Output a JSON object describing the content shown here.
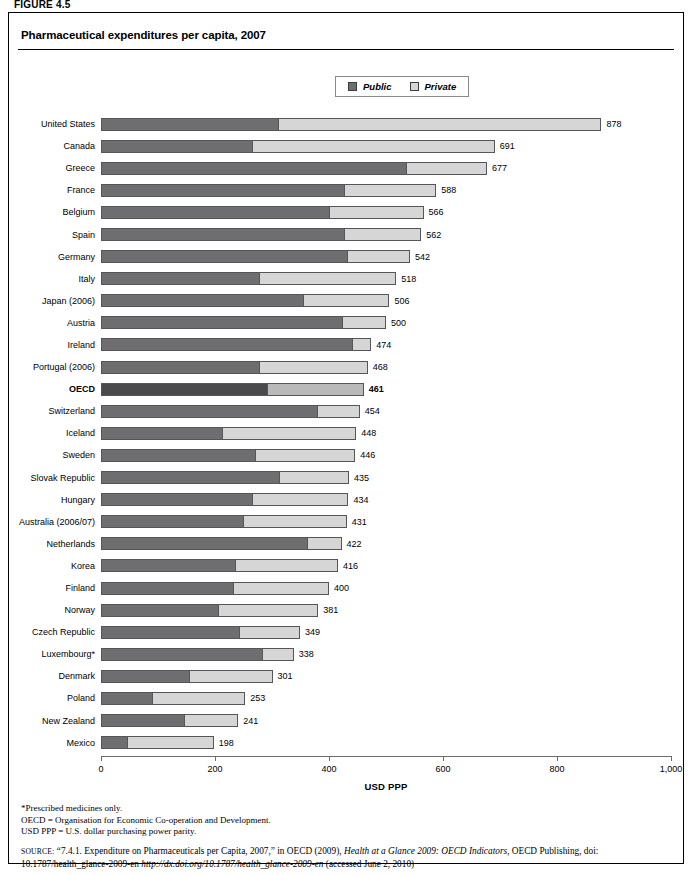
{
  "figure_label": "FIGURE 4.5",
  "chart_title": "Pharmaceutical expenditures per capita, 2007",
  "legend": {
    "public_label": "Public",
    "private_label": "Private",
    "public_color": "#6e6e70",
    "private_color": "#d6d6d6",
    "highlight_color": "#4a4a4c"
  },
  "axis": {
    "title": "USD PPP",
    "ticks": [
      "0",
      "200",
      "400",
      "600",
      "800",
      "1,000"
    ],
    "min": 0,
    "max": 1000
  },
  "notes": [
    "*Prescribed medicines only.",
    "OECD = Organisation for Economic Co-operation and Development.",
    "USD PPP = U.S. dollar purchasing power parity."
  ],
  "source": {
    "caps": "SOURCE:",
    "line1_a": "“7.4.1. Expenditure on Pharmaceuticals per Capita, 2007,” in OECD (2009), ",
    "line1_italic": "Health at a Glance 2009: OECD Indicators",
    "line1_b": ", OECD Publishing,",
    "line2_a": "doi: 10.1787/health_glance-2009-en ",
    "line2_italic": "http://dx.doi.org/10.1787/health_glance-2009-en",
    "line2_b": " (accessed June 2, 2010)"
  },
  "chart_data": {
    "type": "bar",
    "orientation": "horizontal",
    "stacked": true,
    "title": "Pharmaceutical expenditures per capita, 2007",
    "xlabel": "USD PPP",
    "ylabel": "",
    "xlim": [
      0,
      1000
    ],
    "grid": false,
    "legend_position": "top-center",
    "categories": [
      "United States",
      "Canada",
      "Greece",
      "France",
      "Belgium",
      "Spain",
      "Germany",
      "Italy",
      "Japan (2006)",
      "Austria",
      "Ireland",
      "Portugal (2006)",
      "OECD",
      "Switzerland",
      "Iceland",
      "Sweden",
      "Slovak Republic",
      "Hungary",
      "Australia (2006/07)",
      "Netherlands",
      "Korea",
      "Finland",
      "Norway",
      "Czech Republic",
      "Luxembourg*",
      "Denmark",
      "Poland",
      "New Zealand",
      "Mexico"
    ],
    "series": [
      {
        "name": "Public",
        "values": [
          310,
          265,
          535,
          426,
          400,
          426,
          432,
          277,
          355,
          423,
          440,
          277,
          291,
          379,
          213,
          270,
          312,
          265,
          249,
          361,
          235,
          232,
          205,
          242,
          283,
          154,
          90,
          146,
          45
        ]
      },
      {
        "name": "Private",
        "values": [
          568,
          426,
          142,
          162,
          166,
          136,
          110,
          241,
          151,
          77,
          34,
          191,
          170,
          75,
          235,
          176,
          123,
          169,
          182,
          61,
          181,
          168,
          176,
          107,
          55,
          147,
          163,
          95,
          153
        ]
      }
    ],
    "totals": [
      878,
      691,
      677,
      588,
      566,
      562,
      542,
      518,
      506,
      500,
      474,
      468,
      461,
      454,
      448,
      446,
      435,
      434,
      431,
      422,
      416,
      400,
      381,
      349,
      338,
      301,
      253,
      241,
      198
    ],
    "highlight_category": "OECD",
    "rows": [
      {
        "label": "United States",
        "public": 310,
        "private": 568,
        "total": "878",
        "highlight": false
      },
      {
        "label": "Canada",
        "public": 265,
        "private": 426,
        "total": "691",
        "highlight": false
      },
      {
        "label": "Greece",
        "public": 535,
        "private": 142,
        "total": "677",
        "highlight": false
      },
      {
        "label": "France",
        "public": 426,
        "private": 162,
        "total": "588",
        "highlight": false
      },
      {
        "label": "Belgium",
        "public": 400,
        "private": 166,
        "total": "566",
        "highlight": false
      },
      {
        "label": "Spain",
        "public": 426,
        "private": 136,
        "total": "562",
        "highlight": false
      },
      {
        "label": "Germany",
        "public": 432,
        "private": 110,
        "total": "542",
        "highlight": false
      },
      {
        "label": "Italy",
        "public": 277,
        "private": 241,
        "total": "518",
        "highlight": false
      },
      {
        "label": "Japan (2006)",
        "public": 355,
        "private": 151,
        "total": "506",
        "highlight": false
      },
      {
        "label": "Austria",
        "public": 423,
        "private": 77,
        "total": "500",
        "highlight": false
      },
      {
        "label": "Ireland",
        "public": 440,
        "private": 34,
        "total": "474",
        "highlight": false
      },
      {
        "label": "Portugal (2006)",
        "public": 277,
        "private": 191,
        "total": "468",
        "highlight": false
      },
      {
        "label": "OECD",
        "public": 291,
        "private": 170,
        "total": "461",
        "highlight": true
      },
      {
        "label": "Switzerland",
        "public": 379,
        "private": 75,
        "total": "454",
        "highlight": false
      },
      {
        "label": "Iceland",
        "public": 213,
        "private": 235,
        "total": "448",
        "highlight": false
      },
      {
        "label": "Sweden",
        "public": 270,
        "private": 176,
        "total": "446",
        "highlight": false
      },
      {
        "label": "Slovak Republic",
        "public": 312,
        "private": 123,
        "total": "435",
        "highlight": false
      },
      {
        "label": "Hungary",
        "public": 265,
        "private": 169,
        "total": "434",
        "highlight": false
      },
      {
        "label": "Australia (2006/07)",
        "public": 249,
        "private": 182,
        "total": "431",
        "highlight": false
      },
      {
        "label": "Netherlands",
        "public": 361,
        "private": 61,
        "total": "422",
        "highlight": false
      },
      {
        "label": "Korea",
        "public": 235,
        "private": 181,
        "total": "416",
        "highlight": false
      },
      {
        "label": "Finland",
        "public": 232,
        "private": 168,
        "total": "400",
        "highlight": false
      },
      {
        "label": "Norway",
        "public": 205,
        "private": 176,
        "total": "381",
        "highlight": false
      },
      {
        "label": "Czech Republic",
        "public": 242,
        "private": 107,
        "total": "349",
        "highlight": false
      },
      {
        "label": "Luxembourg*",
        "public": 283,
        "private": 55,
        "total": "338",
        "highlight": false
      },
      {
        "label": "Denmark",
        "public": 154,
        "private": 147,
        "total": "301",
        "highlight": false
      },
      {
        "label": "Poland",
        "public": 90,
        "private": 163,
        "total": "253",
        "highlight": false
      },
      {
        "label": "New Zealand",
        "public": 146,
        "private": 95,
        "total": "241",
        "highlight": false
      },
      {
        "label": "Mexico",
        "public": 45,
        "private": 153,
        "total": "198",
        "highlight": false
      }
    ]
  }
}
